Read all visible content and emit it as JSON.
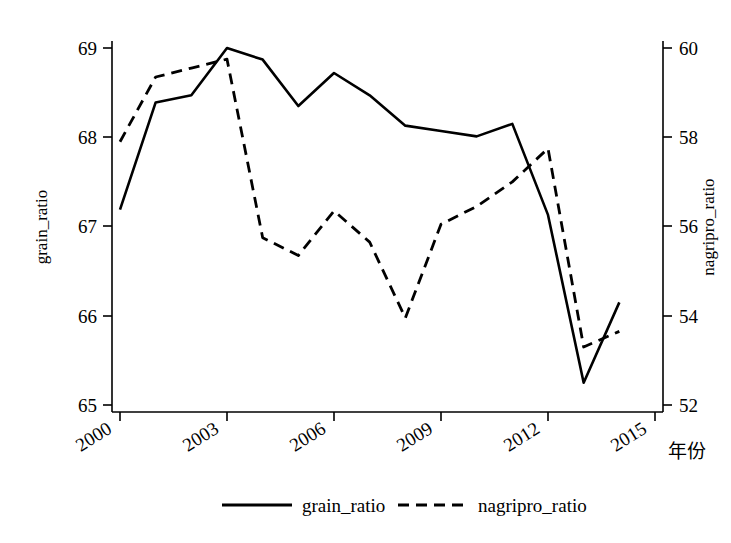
{
  "chart_data": {
    "type": "line",
    "title": "",
    "xlabel": "年份",
    "x": [
      2000,
      2001,
      2002,
      2003,
      2004,
      2005,
      2006,
      2007,
      2008,
      2009,
      2010,
      2011,
      2012,
      2013,
      2014
    ],
    "xticks": [
      2000,
      2003,
      2006,
      2009,
      2012,
      2015
    ],
    "xtick_labels": [
      "2000",
      "2003",
      "2006",
      "2009",
      "2012",
      "2015"
    ],
    "xlim": [
      2000,
      2015
    ],
    "grid": false,
    "legend_position": "bottom",
    "series": [
      {
        "name": "grain_ratio",
        "axis": "left",
        "style": "solid",
        "ylabel": "grain_ratio",
        "ylim": [
          65,
          69
        ],
        "yticks": [
          65,
          66,
          67,
          68,
          69
        ],
        "ytick_labels": [
          "65",
          "66",
          "67",
          "68",
          "69"
        ],
        "values": [
          67.19,
          68.39,
          68.47,
          69.0,
          68.87,
          68.35,
          68.72,
          68.47,
          68.13,
          68.07,
          68.01,
          68.15,
          67.13,
          65.25,
          66.15
        ]
      },
      {
        "name": "nagripro_ratio",
        "axis": "right",
        "style": "dashed",
        "ylabel": "nagripro_ratio",
        "ylim": [
          52,
          60
        ],
        "yticks": [
          52,
          54,
          56,
          58,
          60
        ],
        "ytick_labels": [
          "52",
          "54",
          "56",
          "58",
          "60"
        ],
        "values": [
          57.9,
          59.35,
          59.55,
          59.75,
          55.75,
          55.35,
          56.35,
          55.65,
          53.95,
          56.05,
          56.45,
          57.0,
          57.75,
          53.3,
          53.65
        ]
      }
    ],
    "legend": [
      {
        "label": "grain_ratio",
        "style": "solid"
      },
      {
        "label": "nagripro_ratio",
        "style": "dashed"
      }
    ]
  },
  "axes": {
    "left_title": "grain_ratio",
    "right_title": "nagripro_ratio",
    "x_title": "年份",
    "left_ticks": [
      "69",
      "68",
      "67",
      "66",
      "65"
    ],
    "right_ticks": [
      "60",
      "58",
      "56",
      "54",
      "52"
    ],
    "x_ticks": [
      "2000",
      "2003",
      "2006",
      "2009",
      "2012",
      "2015"
    ]
  },
  "legend": {
    "item_1_label": "grain_ratio",
    "item_2_label": "nagripro_ratio"
  }
}
